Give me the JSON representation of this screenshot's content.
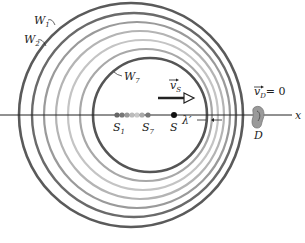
{
  "diagram": {
    "wavefront_labels": {
      "w1": "W",
      "w1_sub": "1",
      "w2": "W",
      "w2_sub": "2",
      "w7": "W",
      "w7_sub": "7"
    },
    "source_velocity_label": "v",
    "source_velocity_sub": "S",
    "detector_velocity_label": "v",
    "detector_velocity_sub": "D",
    "detector_velocity_value": "= 0",
    "source_labels": {
      "s1": "S",
      "s1_sub": "1",
      "s7": "S",
      "s7_sub": "7",
      "s": "S"
    },
    "wavelength_label": "λ′",
    "detector_label": "D",
    "axis_label": "x",
    "colors": {
      "dark_ring": "#555555",
      "light_ring": "#b8b8b8",
      "axis": "#222222"
    }
  }
}
